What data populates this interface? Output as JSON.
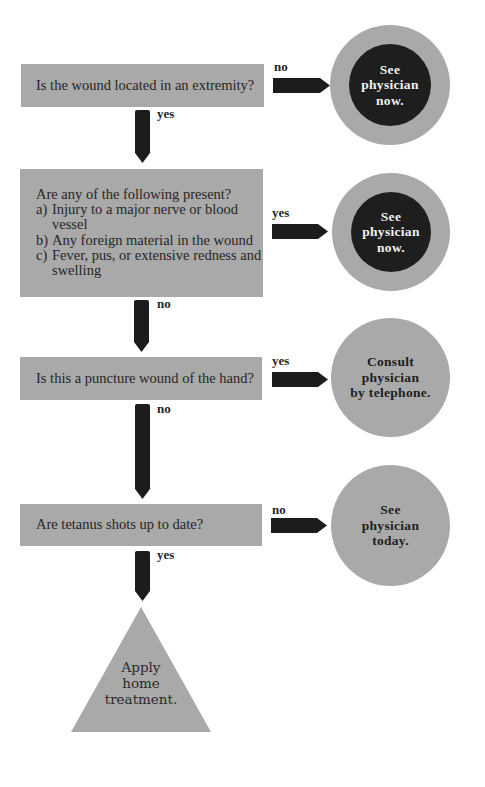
{
  "flowchart": {
    "colors": {
      "box_fill": "#a9a9a9",
      "arrow_fill": "#1c1c1c",
      "urgent_circle_inner": "#1e1e1e",
      "text": "#262626",
      "urgent_text": "#f2f2f2"
    },
    "questions": [
      {
        "id": "q1",
        "text": "Is the wound located in an extremity?",
        "down_label": "yes",
        "side_label": "no"
      },
      {
        "id": "q2",
        "title": "Are any of the following present?",
        "items": [
          {
            "marker": "a)",
            "text": "Injury to a major nerve or blood vessel"
          },
          {
            "marker": "b)",
            "text": "Any foreign material in the wound"
          },
          {
            "marker": "c)",
            "text": "Fever, pus, or extensive redness and swelling"
          }
        ],
        "down_label": "no",
        "side_label": "yes"
      },
      {
        "id": "q3",
        "text": "Is this a puncture wound of the hand?",
        "down_label": "no",
        "side_label": "yes"
      },
      {
        "id": "q4",
        "text": "Are tetanus shots up to date?",
        "down_label": "yes",
        "side_label": "no"
      }
    ],
    "outcomes": [
      {
        "id": "o1",
        "style": "urgent",
        "lines": [
          "See",
          "physician",
          "now."
        ]
      },
      {
        "id": "o2",
        "style": "urgent",
        "lines": [
          "See",
          "physician",
          "now."
        ]
      },
      {
        "id": "o3",
        "style": "normal",
        "lines": [
          "Consult",
          "physician",
          "by telephone."
        ]
      },
      {
        "id": "o4",
        "style": "normal",
        "lines": [
          "See",
          "physician",
          "today."
        ]
      }
    ],
    "final": {
      "shape": "triangle",
      "lines": [
        "Apply",
        "home",
        "treatment."
      ]
    }
  }
}
